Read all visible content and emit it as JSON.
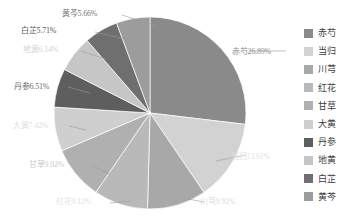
{
  "chart_data": {
    "type": "pie",
    "title": "",
    "categories": [
      "赤芍",
      "当归",
      "川芎",
      "红花",
      "甘草",
      "大黄",
      "丹参",
      "地黄",
      "白芷",
      "黄芩"
    ],
    "values": [
      26.89,
      13.61,
      9.92,
      9.12,
      9.02,
      7.42,
      6.51,
      6.14,
      5.71,
      5.66
    ],
    "value_suffix": "%",
    "labels": [
      "赤芍26.89%",
      "当归13.61%",
      "川芎9.92%",
      "红花9.12%",
      "甘草9.02%",
      "大黄7.42%",
      "丹参6.51%",
      "地黄6.14%",
      "白芷5.71%",
      "黄芩5.66%"
    ],
    "colors": [
      "#8a8a8a",
      "#d2d2d2",
      "#a8a8a8",
      "#b9b9b9",
      "#b0b0b0",
      "#cfcfcf",
      "#5e5e5e",
      "#c6c6c6",
      "#6f6f6f",
      "#9c9c9c"
    ],
    "legend_position": "right",
    "grid": false,
    "start_angle_deg": 0,
    "direction": "clockwise",
    "xlabel": "",
    "ylabel": ""
  },
  "legend": {
    "items": [
      {
        "label": "赤芍",
        "color": "#8a8a8a"
      },
      {
        "label": "当归",
        "color": "#d2d2d2"
      },
      {
        "label": "川芎",
        "color": "#a8a8a8"
      },
      {
        "label": "红花",
        "color": "#b9b9b9"
      },
      {
        "label": "甘草",
        "color": "#b0b0b0"
      },
      {
        "label": "大黄",
        "color": "#cfcfcf"
      },
      {
        "label": "丹参",
        "color": "#5e5e5e"
      },
      {
        "label": "地黄",
        "color": "#c6c6c6"
      },
      {
        "label": "白芷",
        "color": "#6f6f6f"
      },
      {
        "label": "黄芩",
        "color": "#9c9c9c"
      }
    ]
  },
  "callouts": [
    {
      "text": "赤芍26.89%",
      "x": 232,
      "y": 47,
      "color": "#8d8d8d",
      "align": "left"
    },
    {
      "text": "当归13.61%",
      "x": 231,
      "y": 152,
      "color": "#e2e2e2",
      "align": "left"
    },
    {
      "text": "川芎9.92%",
      "x": 200,
      "y": 197,
      "color": "#dcdcdc",
      "align": "left"
    },
    {
      "text": "红花9.12%",
      "x": 56,
      "y": 197,
      "color": "#e4e4e4",
      "align": "left"
    },
    {
      "text": "甘草9.02%",
      "x": 29,
      "y": 160,
      "color": "#c9c9c9",
      "align": "left"
    },
    {
      "text": "大黄7.42%",
      "x": 13,
      "y": 121,
      "color": "#e0e0e0",
      "align": "left"
    },
    {
      "text": "丹参6.51%",
      "x": 14,
      "y": 82,
      "color": "#6c6c6c",
      "align": "left"
    },
    {
      "text": "地黄6.14%",
      "x": 23,
      "y": 45,
      "color": "#d5d5d5",
      "align": "left"
    },
    {
      "text": "白芷5.71%",
      "x": 21,
      "y": 26,
      "color": "#575757",
      "align": "left"
    },
    {
      "text": "黄芩5.66%",
      "x": 62,
      "y": 9,
      "color": "#787878",
      "align": "left"
    }
  ],
  "leaders": [
    {
      "from": [
        286,
        51
      ],
      "to": [
        249,
        51
      ]
    },
    {
      "from": [
        216,
        161
      ],
      "to": [
        246,
        155
      ]
    },
    {
      "from": [
        188,
        199
      ],
      "to": [
        204,
        202
      ]
    },
    {
      "from": [
        131,
        201
      ],
      "to": [
        110,
        203
      ]
    },
    {
      "from": [
        110,
        174
      ],
      "to": [
        91,
        165
      ]
    },
    {
      "from": [
        86,
        130
      ],
      "to": [
        69,
        126
      ]
    },
    {
      "from": [
        90,
        93
      ],
      "to": [
        68,
        87
      ]
    },
    {
      "from": [
        106,
        59
      ],
      "to": [
        81,
        51
      ]
    },
    {
      "from": [
        129,
        40
      ],
      "to": [
        95,
        32
      ]
    },
    {
      "from": [
        156,
        26
      ],
      "to": [
        122,
        15
      ]
    }
  ]
}
